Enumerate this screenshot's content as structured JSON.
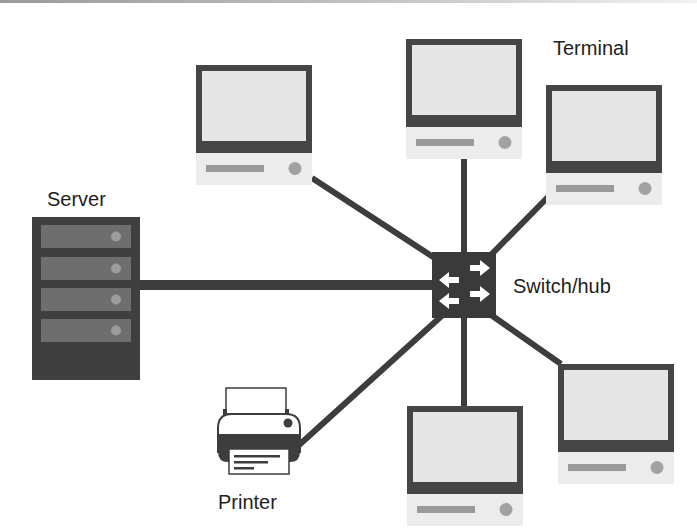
{
  "diagram": {
    "type": "star-network-topology",
    "colors": {
      "link": "#3d3d3d",
      "device_dark": "#454545",
      "screen": "#e6e6e6",
      "base": "#ececec",
      "base_slot": "#9a9a9a",
      "base_button": "#a2a2a2",
      "server_body": "#3f3f3f",
      "server_bay": "#6e6e6e",
      "server_led": "#9c9c9c",
      "switch_body": "#3a3a3a",
      "arrow": "#ffffff",
      "text": "#1e1e1e"
    },
    "hub": {
      "id": "switch",
      "label": "Switch/hub",
      "icon": "switch-arrows-icon"
    },
    "nodes": [
      {
        "id": "server",
        "label": "Server",
        "icon": "server-rack-icon"
      },
      {
        "id": "terminal-top-left",
        "label": "",
        "icon": "terminal-computer-icon"
      },
      {
        "id": "terminal-top-center",
        "label": "",
        "icon": "terminal-computer-icon"
      },
      {
        "id": "terminal-top-right",
        "label": "Terminal",
        "icon": "terminal-computer-icon"
      },
      {
        "id": "terminal-bottom-right",
        "label": "",
        "icon": "terminal-computer-icon"
      },
      {
        "id": "terminal-bottom-center",
        "label": "",
        "icon": "terminal-computer-icon"
      },
      {
        "id": "printer",
        "label": "Printer",
        "icon": "printer-icon"
      }
    ],
    "edges": [
      {
        "from": "switch",
        "to": "server"
      },
      {
        "from": "switch",
        "to": "terminal-top-left"
      },
      {
        "from": "switch",
        "to": "terminal-top-center"
      },
      {
        "from": "switch",
        "to": "terminal-top-right"
      },
      {
        "from": "switch",
        "to": "terminal-bottom-right"
      },
      {
        "from": "switch",
        "to": "terminal-bottom-center"
      },
      {
        "from": "switch",
        "to": "printer"
      }
    ]
  },
  "labels": {
    "terminal": "Terminal",
    "server": "Server",
    "switch": "Switch/hub",
    "printer": "Printer"
  }
}
